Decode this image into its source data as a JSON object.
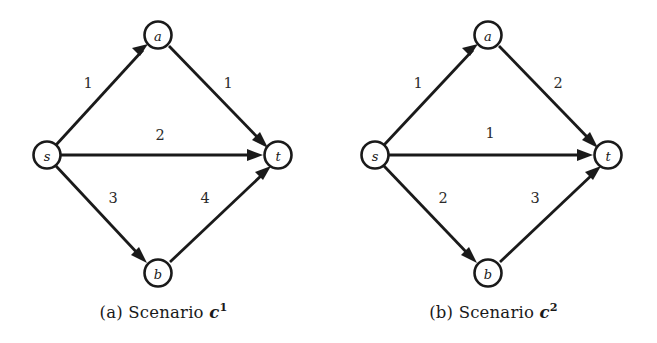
{
  "figure": {
    "type": "network-graph-pair",
    "panels": [
      {
        "id": "a",
        "caption_prefix": "(a) Scenario",
        "caption_symbol": "c",
        "caption_superscript": "1",
        "nodes": [
          {
            "id": "s",
            "label": "s",
            "cx": 47,
            "cy": 155,
            "r": 13.5
          },
          {
            "id": "a",
            "label": "a",
            "cx": 158,
            "cy": 35,
            "r": 13.5
          },
          {
            "id": "t",
            "label": "t",
            "cx": 278,
            "cy": 155,
            "r": 13.5
          },
          {
            "id": "b",
            "label": "b",
            "cx": 158,
            "cy": 273,
            "r": 13.5
          }
        ],
        "edges": [
          {
            "id": "s-a",
            "from": "s",
            "to": "a",
            "cost": "1",
            "lx": 88,
            "ly": 83
          },
          {
            "id": "a-t",
            "from": "a",
            "to": "t",
            "cost": "1",
            "lx": 228,
            "ly": 83
          },
          {
            "id": "s-t",
            "from": "s",
            "to": "t",
            "cost": "2",
            "lx": 160,
            "ly": 135
          },
          {
            "id": "s-b",
            "from": "s",
            "to": "b",
            "cost": "3",
            "lx": 113,
            "ly": 198
          },
          {
            "id": "b-t",
            "from": "b",
            "to": "t",
            "cost": "4",
            "lx": 205,
            "ly": 198
          }
        ]
      },
      {
        "id": "b",
        "caption_prefix": "(b) Scenario",
        "caption_symbol": "c",
        "caption_superscript": "2",
        "nodes": [
          {
            "id": "s",
            "label": "s",
            "cx": 45,
            "cy": 155,
            "r": 13.5
          },
          {
            "id": "a",
            "label": "a",
            "cx": 158,
            "cy": 35,
            "r": 13.5
          },
          {
            "id": "t",
            "label": "t",
            "cx": 278,
            "cy": 155,
            "r": 13.5
          },
          {
            "id": "b",
            "label": "b",
            "cx": 158,
            "cy": 273,
            "r": 13.5
          }
        ],
        "edges": [
          {
            "id": "s-a",
            "from": "s",
            "to": "a",
            "cost": "1",
            "lx": 88,
            "ly": 83
          },
          {
            "id": "a-t",
            "from": "a",
            "to": "t",
            "cost": "2",
            "lx": 228,
            "ly": 83
          },
          {
            "id": "s-t",
            "from": "s",
            "to": "t",
            "cost": "1",
            "lx": 160,
            "ly": 133
          },
          {
            "id": "s-b",
            "from": "s",
            "to": "b",
            "cost": "2",
            "lx": 113,
            "ly": 198
          },
          {
            "id": "b-t",
            "from": "b",
            "to": "t",
            "cost": "3",
            "lx": 205,
            "ly": 198
          }
        ]
      }
    ],
    "colors": {
      "ink": "#1a1a1a",
      "label_ink": "#2a2a2a",
      "background": "#ffffff"
    }
  }
}
